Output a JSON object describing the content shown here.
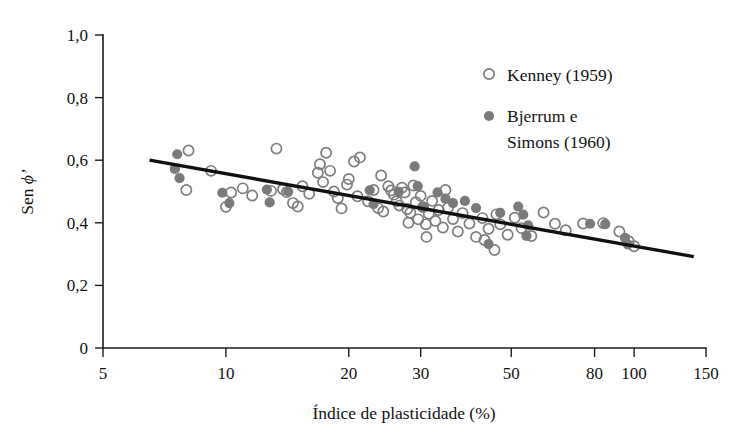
{
  "chart_data": {
    "type": "scatter",
    "title": "",
    "xlabel": "Índice de plasticidade (%)",
    "ylabel": "Sen ϕ'",
    "ylabel_prefix": "Sen ",
    "ylabel_symbol": "ϕ'",
    "xscale": "log",
    "yscale": "linear",
    "xlim": [
      5,
      150
    ],
    "ylim": [
      0,
      1.0
    ],
    "grid": false,
    "xticks": [
      5,
      10,
      20,
      30,
      50,
      80,
      100,
      150
    ],
    "xtick_labels": [
      "5",
      "10",
      "20",
      "30",
      "50",
      "80",
      "100",
      "150"
    ],
    "yticks": [
      0,
      0.2,
      0.4,
      0.6,
      0.8,
      1.0
    ],
    "ytick_labels": [
      "0",
      "0,2",
      "0,4",
      "0,6",
      "0,8",
      "1,0"
    ],
    "legend_position": "upper-right",
    "series": [
      {
        "name": "Kenney  (1959)",
        "marker": "open-circle",
        "color": "#7d7d7d",
        "points": [
          [
            8.1,
            0.631
          ],
          [
            8.0,
            0.505
          ],
          [
            9.2,
            0.566
          ],
          [
            10.3,
            0.497
          ],
          [
            10.0,
            0.451
          ],
          [
            11.6,
            0.487
          ],
          [
            12.9,
            0.502
          ],
          [
            13.3,
            0.637
          ],
          [
            14.1,
            0.498
          ],
          [
            14.6,
            0.463
          ],
          [
            15.4,
            0.517
          ],
          [
            16.0,
            0.493
          ],
          [
            16.8,
            0.56
          ],
          [
            17.0,
            0.587
          ],
          [
            17.3,
            0.53
          ],
          [
            17.6,
            0.624
          ],
          [
            18.0,
            0.566
          ],
          [
            18.4,
            0.5
          ],
          [
            18.8,
            0.479
          ],
          [
            19.2,
            0.446
          ],
          [
            19.8,
            0.522
          ],
          [
            20.6,
            0.596
          ],
          [
            21.3,
            0.609
          ],
          [
            21.0,
            0.485
          ],
          [
            22.3,
            0.469
          ],
          [
            23.0,
            0.505
          ],
          [
            23.6,
            0.447
          ],
          [
            24.3,
            0.436
          ],
          [
            25.0,
            0.517
          ],
          [
            25.4,
            0.503
          ],
          [
            25.8,
            0.49
          ],
          [
            26.2,
            0.469
          ],
          [
            26.6,
            0.455
          ],
          [
            27.0,
            0.512
          ],
          [
            27.4,
            0.497
          ],
          [
            27.8,
            0.444
          ],
          [
            28.3,
            0.432
          ],
          [
            28.8,
            0.519
          ],
          [
            29.2,
            0.466
          ],
          [
            29.6,
            0.411
          ],
          [
            30.0,
            0.486
          ],
          [
            30.4,
            0.45
          ],
          [
            30.9,
            0.395
          ],
          [
            31.4,
            0.429
          ],
          [
            32.0,
            0.47
          ],
          [
            32.6,
            0.406
          ],
          [
            33.2,
            0.441
          ],
          [
            34.0,
            0.385
          ],
          [
            35.0,
            0.448
          ],
          [
            36.0,
            0.412
          ],
          [
            37.0,
            0.372
          ],
          [
            38.0,
            0.431
          ],
          [
            39.5,
            0.398
          ],
          [
            41.0,
            0.355
          ],
          [
            42.5,
            0.415
          ],
          [
            44.0,
            0.381
          ],
          [
            45.5,
            0.313
          ],
          [
            47.0,
            0.395
          ],
          [
            49.0,
            0.362
          ],
          [
            51.0,
            0.416
          ],
          [
            53.0,
            0.383
          ],
          [
            56.0,
            0.358
          ],
          [
            60.0,
            0.433
          ],
          [
            64.0,
            0.397
          ],
          [
            68.0,
            0.376
          ],
          [
            75.0,
            0.398
          ],
          [
            84.0,
            0.399
          ],
          [
            92.0,
            0.372
          ],
          [
            97.0,
            0.341
          ],
          [
            100.0,
            0.325
          ],
          [
            11.0,
            0.51
          ],
          [
            13.8,
            0.507
          ],
          [
            15.0,
            0.452
          ],
          [
            20.0,
            0.54
          ],
          [
            24.0,
            0.551
          ],
          [
            28.0,
            0.4
          ],
          [
            31.0,
            0.355
          ],
          [
            34.5,
            0.505
          ],
          [
            43.0,
            0.345
          ],
          [
            46.0,
            0.427
          ]
        ]
      },
      {
        "name": "Bjerrum e Simons  (1960)",
        "marker": "filled-circle",
        "color": "#7a7a7a",
        "points": [
          [
            7.6,
            0.619
          ],
          [
            7.5,
            0.572
          ],
          [
            7.7,
            0.543
          ],
          [
            9.8,
            0.496
          ],
          [
            10.2,
            0.463
          ],
          [
            12.6,
            0.506
          ],
          [
            12.8,
            0.465
          ],
          [
            14.2,
            0.5
          ],
          [
            22.5,
            0.504
          ],
          [
            23.0,
            0.46
          ],
          [
            26.5,
            0.499
          ],
          [
            29.0,
            0.58
          ],
          [
            29.5,
            0.517
          ],
          [
            33.0,
            0.497
          ],
          [
            34.5,
            0.477
          ],
          [
            36.0,
            0.463
          ],
          [
            38.5,
            0.47
          ],
          [
            41.0,
            0.447
          ],
          [
            44.0,
            0.332
          ],
          [
            52.0,
            0.452
          ],
          [
            53.5,
            0.426
          ],
          [
            55.0,
            0.392
          ],
          [
            54.5,
            0.358
          ],
          [
            78.0,
            0.397
          ],
          [
            85.0,
            0.396
          ],
          [
            95.0,
            0.352
          ],
          [
            96.5,
            0.331
          ],
          [
            30.5,
            0.45
          ],
          [
            47.0,
            0.432
          ]
        ]
      }
    ],
    "trend_line": {
      "label": "linha de tendência",
      "start": [
        6.5,
        0.6
      ],
      "end": [
        140,
        0.292
      ],
      "color": "#111111"
    }
  }
}
